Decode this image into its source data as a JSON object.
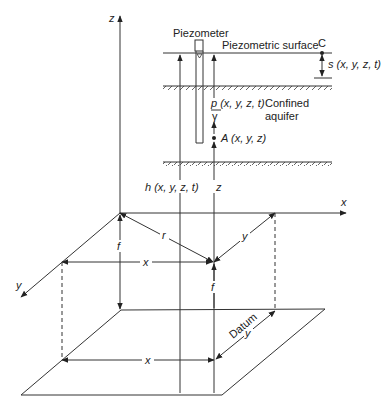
{
  "diagram": {
    "axes": {
      "z_label": "z",
      "x_label": "x",
      "y_label": "y"
    },
    "piezometer": {
      "label": "Piezometer"
    },
    "piezometric_surface": {
      "label": "Piezometric surface",
      "point_label": "C",
      "drawdown_label": "s (x, y, z, t)"
    },
    "aquifer": {
      "label_line1": "Confined",
      "label_line2": "aquifer",
      "pressure_head_numerator": "p (x, y, z, t)",
      "pressure_head_denominator": "γ"
    },
    "point_a": {
      "label": "A (x, y, z)"
    },
    "heads": {
      "h_label": "h (x, y, z, t)",
      "z_label": "z"
    },
    "dimensions": {
      "r_label": "r",
      "x_upper_label": "x",
      "y_upper_label": "y",
      "f_left_label": "f",
      "f_right_label": "f",
      "x_lower_label": "x",
      "y_lower_label": "y"
    },
    "datum": {
      "label": "Datum"
    }
  }
}
